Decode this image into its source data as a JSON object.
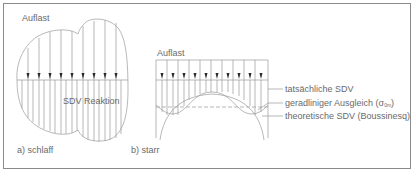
{
  "figure": {
    "left": {
      "load_label": "Auflast",
      "reaction_label": "SDV Reaktion",
      "caption": "a) schlaff"
    },
    "right": {
      "load_label": "Auflast",
      "caption": "b) starr",
      "legend": [
        {
          "text": "tatsächliche SDV"
        },
        {
          "text": "geradliniger Ausgleich (σ",
          "sub": "0m",
          "tail": ")"
        },
        {
          "text": "theoretische SDV (Boussinesq)"
        }
      ]
    },
    "colors": {
      "line": "#9a9a9a",
      "arrow": "#2a2a2a",
      "text": "#6a6a6a",
      "frame": "#8a8a8a"
    }
  }
}
